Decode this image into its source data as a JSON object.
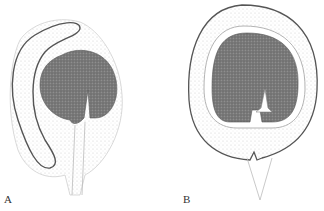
{
  "figure": {
    "panels": [
      {
        "id": "A",
        "label": "A",
        "description": "Curved (anatropous-like) ovule longitudinal section with dark embryo sac/nucellus and bent integument"
      },
      {
        "id": "B",
        "label": "B",
        "description": "Ovate ovule cross-section with outer integument, inner layer, dark central nucellus and white micropylar canal"
      }
    ],
    "colors": {
      "background": "#ffffff",
      "outline": "#555555",
      "stipple_light": "#d9d9d9",
      "stipple_dark": "#6b6b6b"
    }
  }
}
